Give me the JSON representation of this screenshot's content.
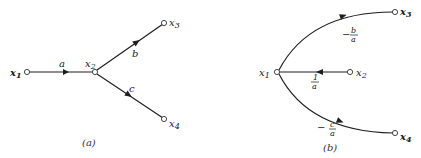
{
  "diagrams": [
    {
      "id": "a",
      "caption": "(a)",
      "nodes": [
        {
          "id": "x1",
          "label": "x",
          "sub": "1"
        },
        {
          "id": "x2",
          "label": "x",
          "sub": "2"
        },
        {
          "id": "x3",
          "label": "x",
          "sub": "3"
        },
        {
          "id": "x4",
          "label": "x",
          "sub": "4"
        }
      ],
      "edges": [
        {
          "from": "x1",
          "to": "x2",
          "gain": "a"
        },
        {
          "from": "x3",
          "to": "x2",
          "gain": "b"
        },
        {
          "from": "x4",
          "to": "x2",
          "gain": "c"
        }
      ]
    },
    {
      "id": "b",
      "caption": "(b)",
      "nodes": [
        {
          "id": "x1",
          "label": "x",
          "sub": "1"
        },
        {
          "id": "x2",
          "label": "x",
          "sub": "2"
        },
        {
          "id": "x3",
          "label": "x",
          "sub": "3"
        },
        {
          "id": "x4",
          "label": "x",
          "sub": "4"
        }
      ],
      "edges": [
        {
          "from": "x2",
          "to": "x1",
          "gain_sign": "",
          "gain_num": "1",
          "gain_den": "a"
        },
        {
          "from": "x3",
          "to": "x1",
          "gain_sign": "−",
          "gain_num": "b",
          "gain_den": "a"
        },
        {
          "from": "x4",
          "to": "x1",
          "gain_sign": "−",
          "gain_num": "c",
          "gain_den": "a"
        }
      ]
    }
  ]
}
